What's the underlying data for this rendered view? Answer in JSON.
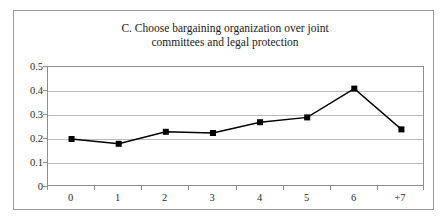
{
  "figure": {
    "title_line1": "C. Choose bargaining organization over joint",
    "title_line2": "committees and legal protection",
    "background_color": "#ffffff",
    "frame_color": "#9a9a9a",
    "gridline_color": "#b9b9b9",
    "series_color": "#000000"
  },
  "chart_data": {
    "type": "line",
    "xlabel": "",
    "ylabel": "",
    "categories": [
      "0",
      "1",
      "2",
      "3",
      "4",
      "5",
      "6",
      "+7"
    ],
    "values": [
      0.2,
      0.18,
      0.23,
      0.225,
      0.27,
      0.29,
      0.41,
      0.24
    ],
    "ylim": [
      0,
      0.5
    ],
    "ytick_labels": [
      "0",
      "0.1",
      "0.2",
      "0.3",
      "0.4",
      "0.5"
    ],
    "ytick_values": [
      0,
      0.1,
      0.2,
      0.3,
      0.4,
      0.5
    ],
    "grid": true,
    "grid_axis": "y",
    "legend": false,
    "legend_position": "none",
    "marker": "square",
    "marker_color": "#000000",
    "line_color": "#000000",
    "series": [
      {
        "name": "Choose bargaining organization",
        "values": [
          0.2,
          0.18,
          0.23,
          0.225,
          0.27,
          0.29,
          0.41,
          0.24
        ]
      }
    ]
  }
}
